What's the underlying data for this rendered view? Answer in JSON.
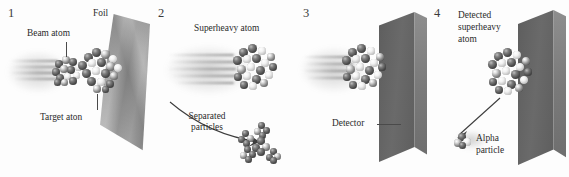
{
  "figure": {
    "style": "grayscale scientific illustration, four sequential panels",
    "background_color": "#fdfdfd",
    "ink_color": "#2b2b2b"
  },
  "panels": [
    {
      "number": "1",
      "labels": {
        "foil": "Foil",
        "beam_atom": "Beam atom",
        "target_atom": "Target aton"
      },
      "elements": {
        "foil_sheet": "crumpled gray foil sheet in perspective",
        "beam_cluster": "beam atom sphere cluster with motion blur",
        "target_cluster": "target atom sphere cluster embedded in foil"
      }
    },
    {
      "number": "2",
      "labels": {
        "superheavy_atom": "Superheavy atom",
        "separated_particles_line1": "Separated",
        "separated_particles_line2": "particles"
      },
      "elements": {
        "superheavy_cluster": "large superheavy atom cluster with motion streaks",
        "debris": "scattered separated particle clumps",
        "curved_arrow": "curved arrow pointing to separated particles"
      }
    },
    {
      "number": "3",
      "labels": {
        "detector": "Detector"
      },
      "elements": {
        "detector_slab": "dark detector slab in perspective",
        "superheavy_cluster": "superheavy atom arriving at detector",
        "leader_line": "horizontal leader line from Detector label to slab"
      }
    },
    {
      "number": "4",
      "labels": {
        "detected_line1": "Detected",
        "detected_line2": "superheavy",
        "detected_line3": "atom",
        "alpha_line1": "Alpha",
        "alpha_line2": "particle"
      },
      "elements": {
        "detector_slab": "dark detector slab in perspective",
        "embedded_cluster": "detected superheavy atom embedded in detector",
        "alpha_cluster": "small four-sphere alpha particle",
        "emission_arrow": "straight arrow from atom to alpha particle"
      }
    }
  ]
}
